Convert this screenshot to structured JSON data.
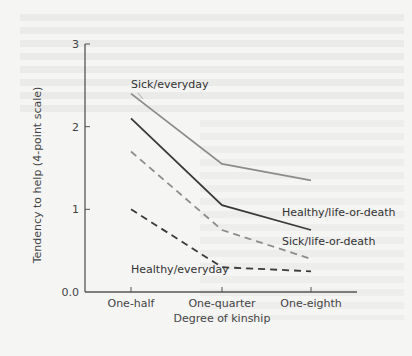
{
  "chart_data": {
    "type": "line",
    "title": "",
    "xlabel": "Degree of kinship",
    "ylabel": "Tendency to help (4-point scale)",
    "categories": [
      "One-half",
      "One-quarter",
      "One-eighth"
    ],
    "ylim": [
      0,
      3
    ],
    "yticks": [
      0,
      1,
      2,
      3
    ],
    "ytick_labels": [
      "0.0",
      "1",
      "2",
      "3"
    ],
    "grid": false,
    "legend": "inline labels",
    "series": [
      {
        "name": "Sick/everyday",
        "values": [
          2.4,
          1.55,
          1.35
        ],
        "color": "#8c8c8c",
        "style": "solid"
      },
      {
        "name": "Healthy/life-or-death",
        "values": [
          2.1,
          1.05,
          0.75
        ],
        "color": "#3a3a3a",
        "style": "solid"
      },
      {
        "name": "Sick/life-or-death",
        "values": [
          1.7,
          0.75,
          0.4
        ],
        "color": "#8c8c8c",
        "style": "dashed"
      },
      {
        "name": "Healthy/everyday",
        "values": [
          1.0,
          0.3,
          0.25
        ],
        "color": "#3a3a3a",
        "style": "dashed"
      }
    ]
  }
}
